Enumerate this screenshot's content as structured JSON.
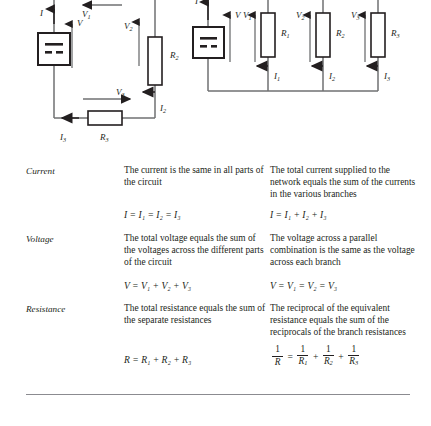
{
  "figure": {
    "series_circuit": {
      "name": "series-circuit",
      "battery_label": "battery-cell",
      "source_voltage": "V",
      "source_current": "I",
      "components": [
        {
          "id": "R1",
          "label": "R",
          "sub": "1",
          "voltage": "V",
          "voltage_sub": "1",
          "orientation": "horizontal-top"
        },
        {
          "id": "R2",
          "label": "R",
          "sub": "2",
          "voltage": "V",
          "voltage_sub": "2",
          "current": "I",
          "current_sub": "2",
          "orientation": "vertical-right"
        },
        {
          "id": "R3",
          "label": "R",
          "sub": "3",
          "voltage": "V",
          "voltage_sub": "3",
          "current": "I",
          "current_sub": "3",
          "orientation": "horizontal-bottom"
        }
      ]
    },
    "parallel_circuit": {
      "name": "parallel-circuit",
      "battery_label": "battery-cell",
      "source_voltage": "V",
      "source_current": "I",
      "branches": [
        {
          "id": "R1",
          "label": "R",
          "sub": "1",
          "voltage": "V",
          "voltage_sub": "1",
          "current": "I",
          "current_sub": "1"
        },
        {
          "id": "R2",
          "label": "R",
          "sub": "2",
          "voltage": "V",
          "voltage_sub": "2",
          "current": "I",
          "current_sub": "2"
        },
        {
          "id": "R3",
          "label": "R",
          "sub": "3",
          "voltage": "V",
          "voltage_sub": "3",
          "current": "I",
          "current_sub": "3"
        }
      ]
    }
  },
  "table": {
    "rows": [
      {
        "label": "Current",
        "series_text": "The current is the same in all parts of the circuit",
        "parallel_text": "The total current supplied to the network equals the sum of the currents in the various branches",
        "series_equation": "I = I₁ = I₂ = I₃",
        "parallel_equation": "I = I₁ + I₂ + I₃"
      },
      {
        "label": "Voltage",
        "series_text": "The total voltage equals the sum of the voltages across the different parts of the circuit",
        "parallel_text": "The voltage across a parallel combination is the same as the voltage across each branch",
        "series_equation": "V = V₁ + V₂ + V₃",
        "parallel_equation": "V = V₁ = V₂ = V₃"
      },
      {
        "label": "Resistance",
        "series_text": "The total resistance equals the sum of the separate resistances",
        "parallel_text": "The reciprocal of the equivalent resistance equals the sum of the reciprocals of the branch resistances",
        "series_equation": "R = R₁ + R₂ + R₃",
        "parallel_equation_fraction": {
          "terms": [
            {
              "num": "1",
              "den": "R",
              "den_sub": ""
            },
            {
              "num": "1",
              "den": "R",
              "den_sub": "1"
            },
            {
              "num": "1",
              "den": "R",
              "den_sub": "2"
            },
            {
              "num": "1",
              "den": "R",
              "den_sub": "3"
            }
          ],
          "operators": [
            "=",
            "+",
            "+"
          ]
        }
      }
    ]
  },
  "colors": {
    "ink": "#231f20",
    "rule": "#8b8b90",
    "wire": "#6f7072",
    "component_stroke": "#231f20",
    "page": "#ffffff"
  }
}
